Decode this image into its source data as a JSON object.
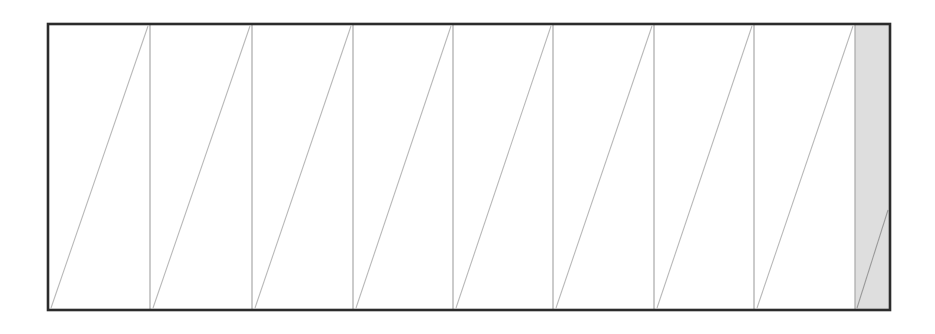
{
  "figure": {
    "name": "sawtooth-ramp-diagram",
    "type": "diagram",
    "canvas": {
      "width": 935,
      "height": 334
    },
    "colors": {
      "background": "#ffffff",
      "frame_stroke": "#2b2b2b",
      "divider_stroke": "#a8a8a8",
      "diagonal_stroke": "#b9b9b9",
      "highlight_fill": "#dedede",
      "highlight_stroke": "#9a9a9a"
    },
    "frame": {
      "x": 48,
      "y": 24,
      "width": 842,
      "height": 286,
      "stroke_width": 2.6
    },
    "cell_count": 9,
    "divider_x": [
      150,
      252,
      353,
      453,
      553,
      654,
      754,
      855
    ],
    "divider_stroke_width": 1.2,
    "diagonal_stroke_width": 1.1,
    "cells": [
      {
        "index": 1,
        "x0": 48,
        "x1": 150,
        "shaded": false,
        "diagonal": {
          "x1": 51,
          "y1": 308,
          "x2": 148,
          "y2": 26
        }
      },
      {
        "index": 2,
        "x0": 150,
        "x1": 252,
        "shaded": false,
        "diagonal": {
          "x1": 153,
          "y1": 308,
          "x2": 250,
          "y2": 26
        }
      },
      {
        "index": 3,
        "x0": 252,
        "x1": 353,
        "shaded": false,
        "diagonal": {
          "x1": 255,
          "y1": 308,
          "x2": 351,
          "y2": 26
        }
      },
      {
        "index": 4,
        "x0": 353,
        "x1": 453,
        "shaded": false,
        "diagonal": {
          "x1": 356,
          "y1": 308,
          "x2": 451,
          "y2": 26
        }
      },
      {
        "index": 5,
        "x0": 453,
        "x1": 553,
        "shaded": false,
        "diagonal": {
          "x1": 456,
          "y1": 308,
          "x2": 551,
          "y2": 26
        }
      },
      {
        "index": 6,
        "x0": 553,
        "x1": 654,
        "shaded": false,
        "diagonal": {
          "x1": 556,
          "y1": 308,
          "x2": 652,
          "y2": 26
        }
      },
      {
        "index": 7,
        "x0": 654,
        "x1": 754,
        "shaded": false,
        "diagonal": {
          "x1": 657,
          "y1": 308,
          "x2": 752,
          "y2": 26
        }
      },
      {
        "index": 8,
        "x0": 754,
        "x1": 855,
        "shaded": false,
        "diagonal": {
          "x1": 757,
          "y1": 308,
          "x2": 853,
          "y2": 26
        }
      },
      {
        "index": 9,
        "x0": 855,
        "x1": 890,
        "shaded": true,
        "diagonal": {
          "x1": 857,
          "y1": 308,
          "x2": 888,
          "y2": 210
        }
      }
    ],
    "highlight_region": {
      "label": "shaded-final-cell",
      "x": 855,
      "y": 25,
      "width": 34,
      "height": 284
    },
    "labels": [],
    "annotations": []
  }
}
